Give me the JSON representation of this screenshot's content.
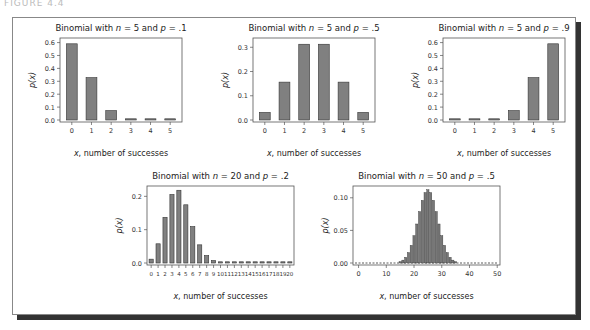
{
  "figure": {
    "header": "FIGURE 4.4"
  },
  "chart_data": [
    {
      "type": "bar",
      "title": "Binomial with n = 5 and p = .1",
      "title_parts": [
        "Binomial with ",
        "n",
        " = 5 and ",
        "p",
        " = .1"
      ],
      "xlabel": "x, number of successes",
      "ylabel": "p(x)",
      "categories": [
        "0",
        "1",
        "2",
        "3",
        "4",
        "5"
      ],
      "values": [
        0.59049,
        0.32805,
        0.0729,
        0.0081,
        0.00045,
        1e-05
      ],
      "yticks": [
        "0.0",
        "0.1",
        "0.2",
        "0.3",
        "0.4",
        "0.5",
        "0.6"
      ],
      "ylim": [
        0,
        0.62
      ]
    },
    {
      "type": "bar",
      "title": "Binomial with n = 5 and p = .5",
      "title_parts": [
        "Binomial with ",
        "n",
        " = 5 and ",
        "p",
        " = .5"
      ],
      "xlabel": "x, number of successes",
      "ylabel": "p(x)",
      "categories": [
        "0",
        "1",
        "2",
        "3",
        "4",
        "5"
      ],
      "values": [
        0.03125,
        0.15625,
        0.3125,
        0.3125,
        0.15625,
        0.03125
      ],
      "yticks": [
        "0.0",
        "0.1",
        "0.2",
        "0.3"
      ],
      "ylim": [
        0,
        0.33
      ]
    },
    {
      "type": "bar",
      "title": "Binomial with n = 5 and p = .9",
      "title_parts": [
        "Binomial with ",
        "n",
        " = 5 and ",
        "p",
        " = .9"
      ],
      "xlabel": "x, number of successes",
      "ylabel": "p(x)",
      "categories": [
        "0",
        "1",
        "2",
        "3",
        "4",
        "5"
      ],
      "values": [
        1e-05,
        0.00045,
        0.0081,
        0.0729,
        0.32805,
        0.59049
      ],
      "yticks": [
        "0.0",
        "0.1",
        "0.2",
        "0.3",
        "0.4",
        "0.5",
        "0.6"
      ],
      "ylim": [
        0,
        0.62
      ]
    },
    {
      "type": "bar",
      "title": "Binomial with n = 20 and p = .2",
      "title_parts": [
        "Binomial with ",
        "n",
        " = 20 and ",
        "p",
        " = .2"
      ],
      "xlabel": "x, number of successes",
      "ylabel": "p(x)",
      "categories": [
        "0",
        "1",
        "2",
        "3",
        "4",
        "5",
        "6",
        "7",
        "8",
        "9",
        "10",
        "11",
        "12",
        "13",
        "14",
        "15",
        "16",
        "17",
        "18",
        "19",
        "20"
      ],
      "values": [
        0.0115,
        0.0576,
        0.1369,
        0.2054,
        0.2182,
        0.1746,
        0.1091,
        0.0545,
        0.0222,
        0.0074,
        0.002,
        0.0005,
        0.0001,
        0,
        0,
        0,
        0,
        0,
        0,
        0,
        0
      ],
      "yticks": [
        "0.0",
        "0.1",
        "0.2"
      ],
      "ylim": [
        0,
        0.225
      ]
    },
    {
      "type": "bar",
      "title": "Binomial with n = 50 and p = .5",
      "title_parts": [
        "Binomial with ",
        "n",
        " = 50 and ",
        "p",
        " = .5"
      ],
      "xlabel": "x, number of successes",
      "ylabel": "p(x)",
      "categories": [
        "0",
        "10",
        "20",
        "30",
        "40",
        "50"
      ],
      "x": [
        15,
        16,
        17,
        18,
        19,
        20,
        21,
        22,
        23,
        24,
        25,
        26,
        27,
        28,
        29,
        30,
        31,
        32,
        33,
        34,
        35
      ],
      "values": [
        0.002,
        0.0044,
        0.0087,
        0.016,
        0.027,
        0.0419,
        0.0598,
        0.0788,
        0.096,
        0.108,
        0.1123,
        0.108,
        0.096,
        0.0788,
        0.0598,
        0.0419,
        0.027,
        0.016,
        0.0087,
        0.0044,
        0.002
      ],
      "yticks": [
        "0.00",
        "0.05",
        "0.10"
      ],
      "ylim": [
        0,
        0.115
      ]
    }
  ]
}
